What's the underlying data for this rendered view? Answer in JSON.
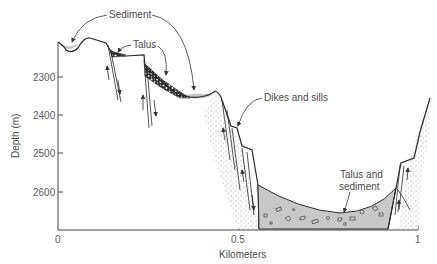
{
  "diagram": {
    "type": "geologic cross-section",
    "y_axis": {
      "label": "Depth (m)",
      "ticks": [
        "2300",
        "2400",
        "2500",
        "2600"
      ]
    },
    "x_axis": {
      "label": "Kilometers",
      "ticks": [
        "0",
        "0.5",
        "1"
      ]
    },
    "annotations": {
      "sediment": "Sediment",
      "talus": "Talus",
      "dikes": "Dikes and sills",
      "talus_sediment_line1": "Talus and",
      "talus_sediment_line2": "sediment"
    },
    "colors": {
      "line": "#2a2a2a",
      "sediment_fill": "#c8c8c8",
      "talus_fill": "#3a3a3a",
      "text": "#4a4a4a"
    }
  }
}
